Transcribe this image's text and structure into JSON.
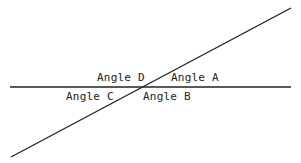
{
  "diagram": {
    "type": "intersecting-lines",
    "line_color": "#222222",
    "background": "#ffffff",
    "lines": {
      "horizontal": {
        "x1": 10,
        "y1": 87,
        "x2": 291,
        "y2": 87
      },
      "transversal": {
        "x1": 11,
        "y1": 157,
        "x2": 291,
        "y2": 8
      }
    },
    "labels": {
      "angle_a": "Angle A",
      "angle_b": "Angle B",
      "angle_c": "Angle C",
      "angle_d": "Angle D"
    }
  }
}
